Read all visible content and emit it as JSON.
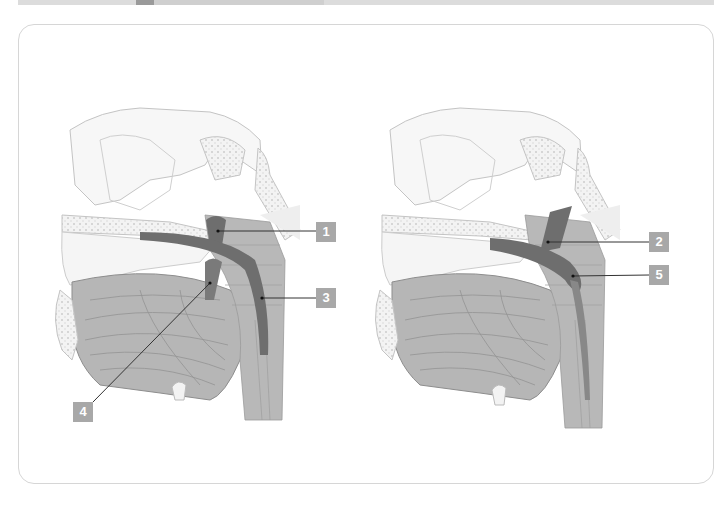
{
  "figure": {
    "panels": [
      {
        "id": "left",
        "labels": [
          {
            "number": "1",
            "x": 316,
            "y": 222
          },
          {
            "number": "3",
            "x": 316,
            "y": 288
          },
          {
            "number": "4",
            "x": 73,
            "y": 402
          }
        ]
      },
      {
        "id": "right",
        "labels": [
          {
            "number": "2",
            "x": 649,
            "y": 232
          },
          {
            "number": "5",
            "x": 649,
            "y": 265
          }
        ]
      }
    ],
    "colors": {
      "label_bg": "#a8a8a8",
      "label_text": "#ffffff",
      "highlight_muscle": "#6e6e6e",
      "muscle": "#b4b4b4",
      "bone_outline": "#bdbdbd",
      "card_border": "#d6d6d6",
      "top_bar": "#dcdcdc",
      "top_bar_accent": "#9a9a9a"
    }
  }
}
